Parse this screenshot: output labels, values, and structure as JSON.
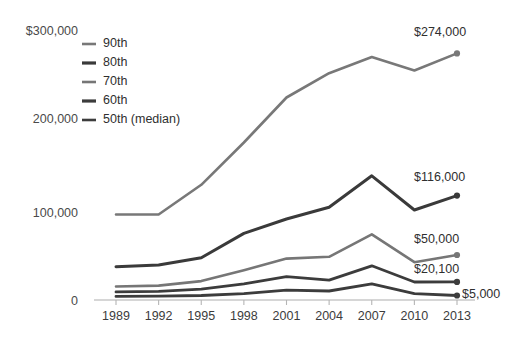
{
  "chart_data": {
    "type": "line",
    "title": "",
    "subtitle": "",
    "xlabel": "",
    "ylabel": "",
    "categories": [
      "1989",
      "1992",
      "1995",
      "1998",
      "2001",
      "2004",
      "2007",
      "2010",
      "2013"
    ],
    "x": [
      1989,
      1992,
      1995,
      1998,
      2001,
      2004,
      2007,
      2010,
      2013
    ],
    "ylim": [
      0,
      300000
    ],
    "yticks": [
      0,
      100000,
      200000,
      300000
    ],
    "ytick_labels": [
      "0",
      "100,000",
      "200,000",
      "$300,000"
    ],
    "grid": false,
    "legend_position": "upper-left-inside",
    "series": [
      {
        "name": "90th",
        "color": "#787878",
        "values": [
          95000,
          95000,
          128000,
          175000,
          225000,
          252000,
          270000,
          255000,
          274000
        ],
        "end_label": "$274,000"
      },
      {
        "name": "80th",
        "color": "#3a3a3a",
        "values": [
          37000,
          39000,
          47000,
          74000,
          90000,
          103000,
          138000,
          100000,
          116000
        ],
        "end_label": "$116,000"
      },
      {
        "name": "70th",
        "color": "#767676",
        "values": [
          15000,
          16000,
          21000,
          33000,
          46000,
          48000,
          73000,
          42000,
          50000
        ],
        "end_label": "$50,000"
      },
      {
        "name": "60th",
        "color": "#3c3c3c",
        "values": [
          9000,
          9500,
          12000,
          18000,
          26000,
          22000,
          38000,
          20000,
          20100
        ],
        "end_label": "$20,100"
      },
      {
        "name": "50th (median)",
        "color": "#3c3c3c",
        "values": [
          4000,
          4200,
          5000,
          7000,
          11000,
          10000,
          18000,
          7000,
          5000
        ],
        "end_label": "$5,000"
      }
    ],
    "legend_entries": [
      {
        "label": "90th",
        "color": "#787878"
      },
      {
        "label": "80th",
        "color": "#3a3a3a"
      },
      {
        "label": "70th",
        "color": "#767676"
      },
      {
        "label": "60th",
        "color": "#3c3c3c"
      },
      {
        "label": "50th (median)",
        "color": "#3c3c3c"
      }
    ],
    "end_labels": [
      "$274,000",
      "$116,000",
      "$50,000",
      "$20,100",
      "$5,000"
    ]
  },
  "axes": {
    "y_ticks": [
      "$300,000",
      "200,000",
      "100,000",
      "0"
    ],
    "x_ticks": [
      "1989",
      "1992",
      "1995",
      "1998",
      "2001",
      "2004",
      "2007",
      "2010",
      "2013"
    ]
  },
  "colors": {
    "light_series": "#787878",
    "dark_series": "#3a3a3a",
    "axis": "#c9c9c9",
    "text": "#3c3c3c",
    "background": "#ffffff"
  }
}
